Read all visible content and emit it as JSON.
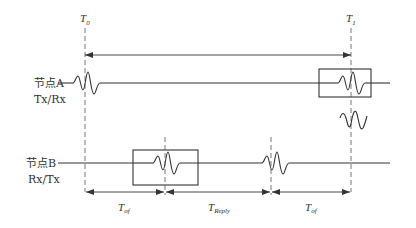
{
  "diagram": {
    "type": "timing-diagram",
    "time_markers": [
      {
        "label": "T",
        "subscript": "0"
      },
      {
        "label": "T",
        "subscript": "1"
      }
    ],
    "nodes": [
      {
        "name": "节点A",
        "mode": "Tx/Rx"
      },
      {
        "name": "节点B",
        "mode": "Rx/Tx"
      }
    ],
    "intervals": [
      {
        "label": "T",
        "subscript": "of"
      },
      {
        "label": "T",
        "subscript": "Reply"
      },
      {
        "label": "T",
        "subscript": "of"
      }
    ],
    "colors": {
      "line": "#333333",
      "background": "#ffffff"
    }
  }
}
